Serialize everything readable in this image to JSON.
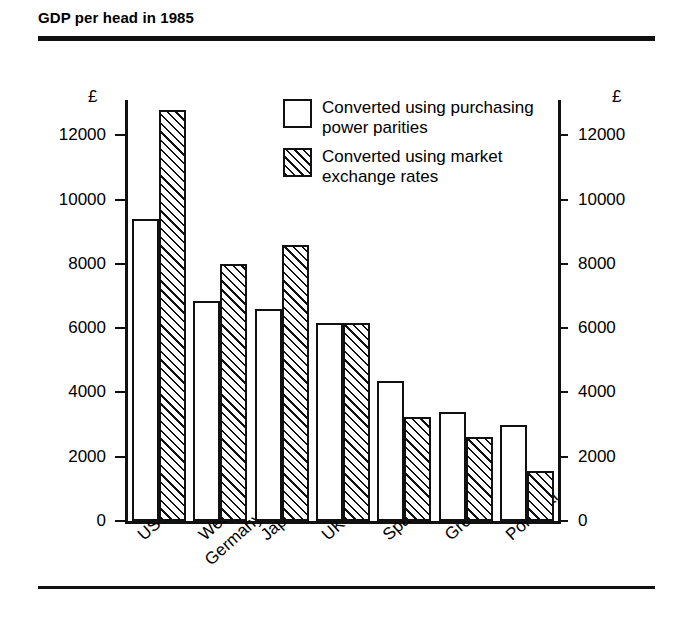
{
  "header": {
    "title": "GDP per head in 1985"
  },
  "legend": {
    "position": "inside-top-center",
    "items": [
      {
        "swatch": "open-square",
        "line1": "Converted using purchasing",
        "line2": "power parities",
        "label": "Converted using purchasing power parities"
      },
      {
        "swatch": "hatched-square",
        "line1": "Converted using market",
        "line2": "exchange rates",
        "label": "Converted using market exchange rates"
      }
    ]
  },
  "axes": {
    "unit_left": "£",
    "unit_right": "£",
    "ticks": [
      "0",
      "2000",
      "4000",
      "6000",
      "8000",
      "10000",
      "12000"
    ],
    "ymin": 0,
    "ymax": 13100
  },
  "chart_data": {
    "type": "bar",
    "title": "GDP per head in 1985",
    "xlabel": "",
    "ylabel": "£",
    "ylim": [
      0,
      13100
    ],
    "yticks": [
      0,
      2000,
      4000,
      6000,
      8000,
      10000,
      12000
    ],
    "grid": false,
    "legend_position": "inside top center",
    "categories": [
      "US",
      "West Germany",
      "Japan",
      "UK",
      "Spain",
      "Greece",
      "Portugal"
    ],
    "series": [
      {
        "name": "Converted using purchasing power parities",
        "style": "open",
        "values": [
          9400,
          6850,
          6600,
          6150,
          4350,
          3400,
          3000
        ]
      },
      {
        "name": "Converted using market exchange rates",
        "style": "hatched",
        "values": [
          12800,
          8000,
          8600,
          6150,
          3250,
          2600,
          1550
        ]
      }
    ]
  }
}
